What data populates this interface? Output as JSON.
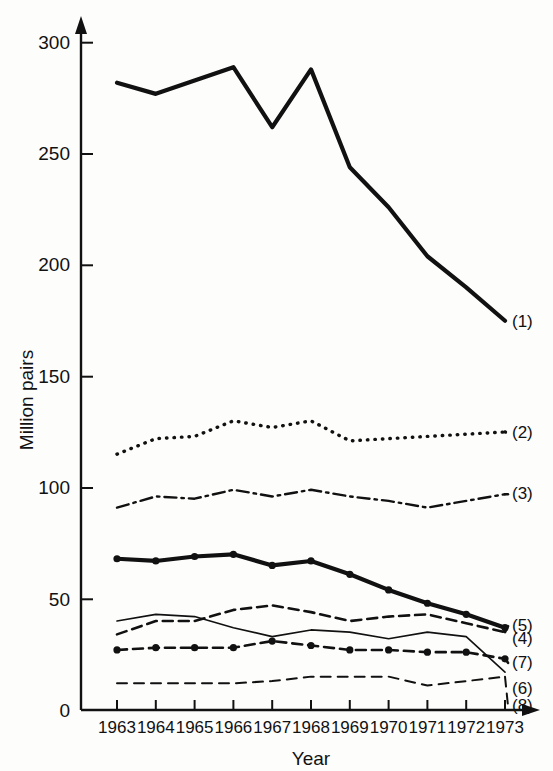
{
  "chart_data": {
    "type": "line",
    "title": "",
    "xlabel": "Year",
    "ylabel": "Million pairs",
    "categories": [
      1963,
      1964,
      1965,
      1966,
      1967,
      1968,
      1969,
      1970,
      1971,
      1972,
      1973
    ],
    "x": [
      1963,
      1964,
      1965,
      1966,
      1967,
      1968,
      1969,
      1970,
      1971,
      1972,
      1973
    ],
    "xlim": [
      1963,
      1973
    ],
    "ylim": [
      0,
      300
    ],
    "yticks": [
      0,
      50,
      100,
      150,
      200,
      250,
      300
    ],
    "xticks": [
      1963,
      1964,
      1965,
      1966,
      1967,
      1968,
      1969,
      1970,
      1971,
      1972,
      1973
    ],
    "grid": false,
    "legend_position": "right-inline",
    "series": [
      {
        "name": "(1)",
        "label": "(1)",
        "style": "solid-thick",
        "markers": false,
        "values": [
          282,
          277,
          283,
          289,
          262,
          288,
          244,
          226,
          204,
          190,
          175
        ]
      },
      {
        "name": "(2)",
        "label": "(2)",
        "style": "dotted",
        "markers": false,
        "values": [
          115,
          122,
          123,
          130,
          127,
          130,
          121,
          122,
          123,
          124,
          125
        ]
      },
      {
        "name": "(3)",
        "label": "(3)",
        "style": "dash-dot",
        "markers": false,
        "values": [
          91,
          96,
          95,
          99,
          96,
          99,
          96,
          94,
          91,
          94,
          97
        ]
      },
      {
        "name": "(4)",
        "label": "(4)",
        "style": "solid-thick-markers",
        "markers": true,
        "values": [
          68,
          67,
          69,
          70,
          65,
          67,
          61,
          54,
          48,
          43,
          37
        ]
      },
      {
        "name": "(5)",
        "label": "(5)",
        "style": "dashed",
        "markers": false,
        "values": [
          34,
          40,
          40,
          45,
          47,
          44,
          40,
          42,
          43,
          39,
          35
        ]
      },
      {
        "name": "(6)",
        "label": "(6)",
        "style": "solid-thin",
        "markers": false,
        "values": [
          40,
          43,
          42,
          37,
          33,
          36,
          35,
          32,
          35,
          33,
          17
        ]
      },
      {
        "name": "(7)",
        "label": "(7)",
        "style": "dashed-markers",
        "markers": true,
        "values": [
          27,
          28,
          28,
          28,
          31,
          29,
          27,
          27,
          26,
          26,
          23
        ]
      },
      {
        "name": "(8)",
        "label": "(8)",
        "style": "dashed-thin",
        "markers": false,
        "values": [
          12,
          12,
          12,
          12,
          13,
          15,
          15,
          15,
          11,
          13,
          15
        ]
      }
    ]
  },
  "axes": {
    "y_axis_title": "Million pairs",
    "x_axis_title": "Year",
    "y_tick_labels": [
      "0",
      "50",
      "100",
      "150",
      "200",
      "250",
      "300"
    ],
    "x_tick_labels": [
      "1963",
      "1964",
      "1965",
      "1966",
      "1967",
      "1968",
      "1969",
      "1970",
      "1971",
      "1972",
      "1973"
    ]
  },
  "series_labels": [
    "(1)",
    "(2)",
    "(3)",
    "(4)",
    "(5)",
    "(6)",
    "(7)",
    "(8)"
  ],
  "colors": {
    "ink": "#111111",
    "background": "#fdfdfc"
  }
}
